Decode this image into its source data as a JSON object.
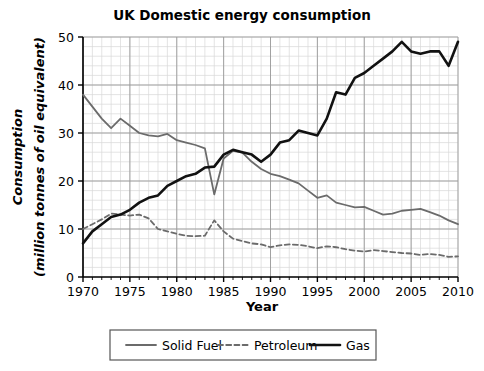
{
  "chart_data": {
    "type": "line",
    "title": "UK Domestic energy consumption",
    "xlabel": "Year",
    "ylabel": "Consumption\n(million tonnes of oil equivalent)",
    "ylabel_line1": "Consumption",
    "ylabel_line2": "(million tonnes of oil equivalent)",
    "xlim": [
      1970,
      2010
    ],
    "ylim": [
      0,
      50
    ],
    "xticks": [
      1970,
      1975,
      1980,
      1985,
      1990,
      1995,
      2000,
      2005,
      2010
    ],
    "xtick_labels": [
      "1970",
      "1975",
      "1980",
      "1985",
      "1990",
      "1995",
      "2000",
      "2005",
      "2010"
    ],
    "yticks": [
      0,
      10,
      20,
      30,
      40,
      50
    ],
    "ytick_labels": [
      "0",
      "10",
      "20",
      "30",
      "40",
      "50"
    ],
    "x_minor_step": 1,
    "y_minor_step": 2,
    "grid": true,
    "grid_color": "#d8d8d8",
    "grid_major_color": "#9a9a9a",
    "legend_position": "below",
    "x": [
      1970,
      1971,
      1972,
      1973,
      1974,
      1975,
      1976,
      1977,
      1978,
      1979,
      1980,
      1981,
      1982,
      1983,
      1984,
      1985,
      1986,
      1987,
      1988,
      1989,
      1990,
      1991,
      1992,
      1993,
      1994,
      1995,
      1996,
      1997,
      1998,
      1999,
      2000,
      2001,
      2002,
      2003,
      2004,
      2005,
      2006,
      2007,
      2008,
      2009,
      2010
    ],
    "series": [
      {
        "name": "Solid Fuel",
        "color": "#6b6b6b",
        "style": "solid",
        "width": 1.8,
        "values": [
          38.0,
          35.5,
          33.0,
          31.0,
          33.0,
          31.5,
          30.0,
          29.5,
          29.3,
          29.8,
          28.5,
          28.0,
          27.5,
          26.8,
          17.2,
          24.7,
          26.3,
          25.9,
          24.0,
          22.5,
          21.5,
          21.0,
          20.3,
          19.5,
          18.0,
          16.5,
          17.0,
          15.5,
          15.0,
          14.5,
          14.6,
          13.8,
          13.0,
          13.2,
          13.8,
          14.0,
          14.2,
          13.5,
          12.8,
          11.8,
          11.0
        ]
      },
      {
        "name": "Petroleum",
        "color": "#6b6b6b",
        "style": "dashed",
        "width": 1.8,
        "values": [
          10.0,
          11.0,
          12.0,
          13.2,
          13.0,
          12.8,
          13.0,
          12.2,
          10.0,
          9.5,
          9.0,
          8.6,
          8.5,
          8.6,
          11.8,
          9.5,
          8.0,
          7.5,
          7.0,
          6.8,
          6.2,
          6.6,
          6.8,
          6.7,
          6.4,
          6.0,
          6.4,
          6.2,
          5.8,
          5.5,
          5.3,
          5.6,
          5.4,
          5.2,
          5.0,
          4.9,
          4.6,
          4.8,
          4.6,
          4.2,
          4.3
        ]
      },
      {
        "name": "Gas",
        "color": "#111111",
        "style": "solid",
        "width": 2.6,
        "values": [
          7.0,
          9.5,
          11.0,
          12.5,
          13.0,
          14.0,
          15.5,
          16.5,
          17.0,
          19.0,
          20.0,
          21.0,
          21.5,
          22.8,
          23.0,
          25.5,
          26.5,
          26.0,
          25.5,
          24.0,
          25.5,
          28.0,
          28.5,
          30.5,
          30.0,
          29.5,
          33.0,
          38.5,
          38.0,
          41.5,
          42.5,
          44.0,
          45.5,
          47.0,
          49.0,
          47.0,
          46.5,
          47.0,
          47.0,
          44.0,
          49.0
        ]
      }
    ],
    "legend": [
      {
        "label": "Solid Fuel",
        "color": "#6b6b6b",
        "style": "solid",
        "width": 1.8
      },
      {
        "label": "Petroleum",
        "color": "#6b6b6b",
        "style": "dashed",
        "width": 1.8
      },
      {
        "label": "Gas",
        "color": "#111111",
        "style": "solid",
        "width": 2.6
      }
    ]
  }
}
